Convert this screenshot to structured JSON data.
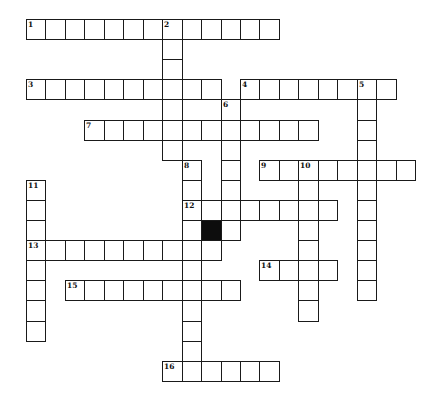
{
  "puzzle": {
    "type": "crossword",
    "grid": {
      "origin_x": 26,
      "origin_y": 19,
      "cell_w": 19.45,
      "cell_h": 20.1
    },
    "colors": {
      "line": "#1a1a1a",
      "cell": "#ffffff",
      "block": "#0d0d0d"
    },
    "entries": [
      {
        "number": "1",
        "direction": "across",
        "row": 0,
        "col": 0,
        "length": 13
      },
      {
        "number": "2",
        "direction": "down",
        "row": 0,
        "col": 7,
        "length": 7
      },
      {
        "number": "3",
        "direction": "across",
        "row": 3,
        "col": 0,
        "length": 10
      },
      {
        "number": "4",
        "direction": "across",
        "row": 3,
        "col": 11,
        "length": 8
      },
      {
        "number": "5",
        "direction": "down",
        "row": 3,
        "col": 17,
        "length": 11
      },
      {
        "number": "6",
        "direction": "down",
        "row": 4,
        "col": 10,
        "length": 7
      },
      {
        "number": "7",
        "direction": "across",
        "row": 5,
        "col": 3,
        "length": 12
      },
      {
        "number": "8",
        "direction": "down",
        "row": 7,
        "col": 8,
        "length": 11
      },
      {
        "number": "9",
        "direction": "across",
        "row": 7,
        "col": 12,
        "length": 8
      },
      {
        "number": "10",
        "direction": "down",
        "row": 7,
        "col": 14,
        "length": 8
      },
      {
        "number": "11",
        "direction": "down",
        "row": 8,
        "col": 0,
        "length": 8
      },
      {
        "number": "12",
        "direction": "across",
        "row": 9,
        "col": 8,
        "length": 8
      },
      {
        "number": "13",
        "direction": "across",
        "row": 11,
        "col": 0,
        "length": 10
      },
      {
        "number": "14",
        "direction": "across",
        "row": 12,
        "col": 12,
        "length": 4
      },
      {
        "number": "15",
        "direction": "across",
        "row": 13,
        "col": 2,
        "length": 9
      },
      {
        "number": "16",
        "direction": "across",
        "row": 17,
        "col": 7,
        "length": 6
      }
    ],
    "blocks": [
      {
        "row": 10,
        "col": 9
      }
    ]
  }
}
